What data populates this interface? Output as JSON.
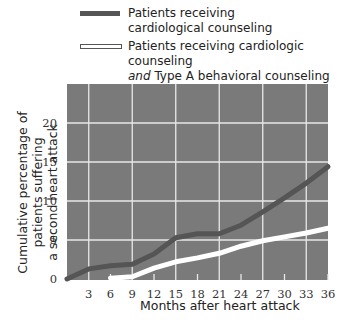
{
  "chart_data": {
    "type": "line",
    "title": "",
    "xlabel": "Months after heart attack",
    "ylabel": "Cumulative percentage of patients suffering a second heart attack",
    "ylabel_lines": [
      "Cumulative percentage of patients suffering",
      "a second heart attack"
    ],
    "x_ticks": [
      3,
      6,
      9,
      12,
      15,
      18,
      21,
      24,
      27,
      30,
      33,
      36
    ],
    "y_ticks": [
      0,
      5,
      10,
      15,
      20
    ],
    "xlim": [
      0,
      36
    ],
    "ylim": [
      0,
      25
    ],
    "grid": true,
    "legend_position": "top",
    "series": [
      {
        "name": "Patients receiving cardiological counseling",
        "legend_lines": [
          "Patients receiving",
          "cardiological counseling"
        ],
        "color": "#555555",
        "x": [
          0,
          3,
          6,
          9,
          12,
          15,
          18,
          21,
          24,
          27,
          30,
          33,
          36
        ],
        "values": [
          0,
          1.3,
          1.7,
          1.9,
          3.2,
          5.3,
          5.8,
          5.8,
          6.9,
          8.6,
          10.4,
          12.3,
          14.4
        ]
      },
      {
        "name": "Patients receiving cardiologic counseling and Type A behavioral counseling",
        "legend_lines": [
          "Patients receiving cardiologic counseling",
          "and",
          " Type A behavioral counseling"
        ],
        "color": "#ffffff",
        "x": [
          6,
          9,
          12,
          15,
          18,
          21,
          24,
          27,
          30,
          33,
          36
        ],
        "values": [
          0.1,
          0.3,
          1.4,
          2.2,
          2.7,
          3.3,
          4.2,
          4.9,
          5.4,
          5.9,
          6.5
        ]
      }
    ]
  },
  "legend": {
    "item1_line1": "Patients receiving",
    "item1_line2": "cardiological counseling",
    "item2_line1": "Patients receiving cardiologic counseling",
    "item2_italic": "and",
    "item2_line2_rest": " Type A behavioral counseling"
  },
  "colors": {
    "plot_bg": "#7a7a7a",
    "grid": "#e8e8e8",
    "series1": "#555555",
    "series2": "#ffffff"
  }
}
